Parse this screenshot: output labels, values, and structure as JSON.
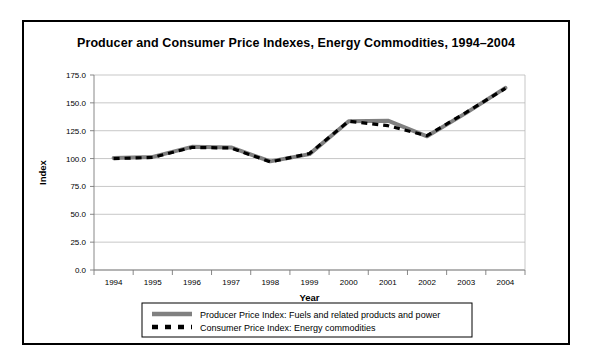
{
  "figure": {
    "title": "Producer and Consumer Price Indexes, Energy Commodities, 1994–2004",
    "border_color": "#000000",
    "background": "#ffffff"
  },
  "chart_data": {
    "type": "line",
    "title": "Producer and Consumer Price Indexes, Energy Commodities, 1994–2004",
    "xlabel": "Year",
    "ylabel": "Index",
    "categories": [
      "1994",
      "1995",
      "1996",
      "1997",
      "1998",
      "1999",
      "2000",
      "2001",
      "2002",
      "2003",
      "2004"
    ],
    "x": [
      1994,
      1995,
      1996,
      1997,
      1998,
      1999,
      2000,
      2001,
      2002,
      2003,
      2004
    ],
    "ylim": [
      0.0,
      175.0
    ],
    "yticks": [
      "0.0",
      "25.0",
      "50.0",
      "75.0",
      "100.0",
      "125.0",
      "150.0",
      "175.0"
    ],
    "ytick_values": [
      0.0,
      25.0,
      50.0,
      75.0,
      100.0,
      125.0,
      150.0,
      175.0
    ],
    "grid": true,
    "legend_position": "below-plot",
    "series": [
      {
        "name": "Producer Price Index: Fuels and related products and power",
        "color": "#808080",
        "style": "solid",
        "width": 4,
        "values": [
          100.5,
          101.5,
          110.5,
          110.0,
          97.5,
          104.0,
          133.5,
          134.0,
          120.0,
          141.0,
          163.5
        ]
      },
      {
        "name": "Consumer Price Index: Energy commodities",
        "color": "#000000",
        "style": "dashed",
        "width": 3.2,
        "values": [
          100.0,
          101.0,
          110.0,
          109.5,
          97.0,
          104.5,
          133.5,
          129.5,
          120.5,
          141.5,
          163.0
        ]
      }
    ]
  },
  "legend": {
    "items": [
      {
        "label": "Producer Price Index: Fuels and related products and power",
        "swatch": "solid-gray-line"
      },
      {
        "label": "Consumer Price Index: Energy commodities",
        "swatch": "dashed-black-line"
      }
    ]
  }
}
